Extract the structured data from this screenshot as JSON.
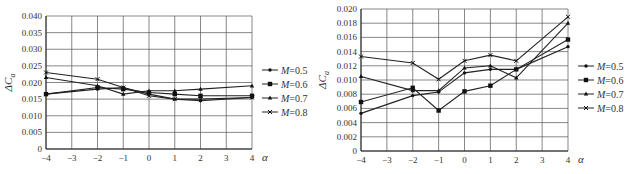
{
  "chart_data": [
    {
      "type": "line",
      "title": "",
      "xlabel": "α",
      "ylabel": "ΔC_a",
      "x": [
        -4,
        -2,
        -1,
        0,
        1,
        2,
        4
      ],
      "xticks": [
        -4,
        -3,
        -2,
        -1,
        0,
        1,
        2,
        3,
        4
      ],
      "yticks": [
        "0",
        "0.005",
        "0.010",
        "0.015",
        "0.020",
        "0.025",
        "0.030",
        "0.035",
        "0.040"
      ],
      "ylim": [
        0,
        0.04
      ],
      "xlim": [
        -4,
        4
      ],
      "grid": true,
      "legend_position": "right",
      "series": [
        {
          "name": "M=0.5",
          "marker": "diamond",
          "values": [
            0.0165,
            0.018,
            0.0185,
            0.0165,
            0.015,
            0.0145,
            0.0155
          ]
        },
        {
          "name": "M=0.6",
          "marker": "square",
          "values": [
            0.0165,
            0.0185,
            0.018,
            0.017,
            0.0165,
            0.016,
            0.016
          ]
        },
        {
          "name": "M=0.7",
          "marker": "triangle",
          "values": [
            0.0215,
            0.019,
            0.0165,
            0.0175,
            0.0175,
            0.018,
            0.019
          ]
        },
        {
          "name": "M=0.8",
          "marker": "cross",
          "values": [
            0.023,
            0.021,
            0.0185,
            0.016,
            0.015,
            0.015,
            0.0155
          ]
        }
      ]
    },
    {
      "type": "line",
      "title": "",
      "xlabel": "α",
      "ylabel": "ΔC_a",
      "x": [
        -4,
        -2,
        -1,
        0,
        1,
        2,
        4
      ],
      "xticks": [
        -4,
        -3,
        -2,
        -1,
        0,
        1,
        2,
        3,
        4
      ],
      "yticks": [
        "0",
        "0.002",
        "0.004",
        "0.006",
        "0.008",
        "0.010",
        "0.012",
        "0.014",
        "0.016",
        "0.018",
        "0.020"
      ],
      "ylim": [
        0,
        0.02
      ],
      "xlim": [
        -4,
        4
      ],
      "grid": true,
      "legend_position": "right",
      "series": [
        {
          "name": "M=0.5",
          "marker": "diamond",
          "values": [
            0.0053,
            0.0078,
            0.0083,
            0.011,
            0.0115,
            0.0115,
            0.0147
          ]
        },
        {
          "name": "M=0.6",
          "marker": "square",
          "values": [
            0.0069,
            0.0089,
            0.0057,
            0.0084,
            0.0092,
            0.0115,
            0.0157
          ]
        },
        {
          "name": "M=0.7",
          "marker": "triangle",
          "values": [
            0.0105,
            0.0085,
            0.0085,
            0.0117,
            0.012,
            0.0103,
            0.018
          ]
        },
        {
          "name": "M=0.8",
          "marker": "cross",
          "values": [
            0.0133,
            0.0124,
            0.0101,
            0.0127,
            0.0135,
            0.0127,
            0.0189
          ]
        }
      ]
    }
  ],
  "left_chart": {
    "ylabel": "ΔC",
    "ylabel_sub": "a",
    "xlabel": "α",
    "legend": [
      "M=0.5",
      "M=0.6",
      "M=0.7",
      "M=0.8"
    ]
  },
  "right_chart": {
    "ylabel": "ΔC",
    "ylabel_sub": "a",
    "xlabel": "α",
    "legend": [
      "M=0.5",
      "M=0.6",
      "M=0.7",
      "M=0.8"
    ]
  }
}
